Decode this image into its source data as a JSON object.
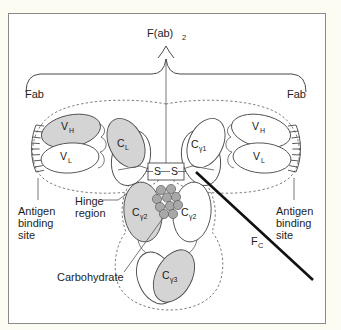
{
  "figure": {
    "background_color": "#fdfcf2",
    "panel_color": "#ffffff",
    "border_color": "#8a8a8a"
  },
  "labels": {
    "fab2": "F(ab)",
    "fab2_sub": "2",
    "fab_left": "Fab",
    "fab_right": "Fab",
    "fc": "F",
    "fc_sub": "C",
    "hinge_line1": "Hinge",
    "hinge_line2": "region",
    "carbohydrate": "Carbohydrate",
    "antigen_left_line1": "Antigen",
    "antigen_left_line2": "binding",
    "antigen_left_line3": "site",
    "antigen_right_line1": "Antigen",
    "antigen_right_line2": "binding",
    "antigen_right_line3": "site",
    "disulfide_left": "S",
    "disulfide_right": "S"
  },
  "domains": {
    "left_fab": [
      {
        "name": "V",
        "sub": "H",
        "shaded": true
      },
      {
        "name": "V",
        "sub": "L",
        "shaded": false
      },
      {
        "name": "C",
        "sub": "L",
        "shaded": true
      }
    ],
    "right_fab": [
      {
        "name": "C",
        "sub": "γ1",
        "shaded": false
      },
      {
        "name": "V",
        "sub": "H",
        "shaded": false
      },
      {
        "name": "V",
        "sub": "L",
        "shaded": false
      }
    ],
    "fc_upper": [
      {
        "name": "C",
        "sub": "γ2",
        "shaded": true
      },
      {
        "name": "C",
        "sub": "γ2",
        "shaded": false
      }
    ],
    "fc_lower": [
      {
        "name": "C",
        "sub": "γ3",
        "shaded": true
      }
    ]
  },
  "colors": {
    "shaded_fill": "#d4d4d4",
    "plain_fill": "#ffffff",
    "outline": "#4a4a4a",
    "carbohydrate_fill": "#a8a8a8",
    "fc_leader": "#111111"
  },
  "carbohydrate_units": 10
}
